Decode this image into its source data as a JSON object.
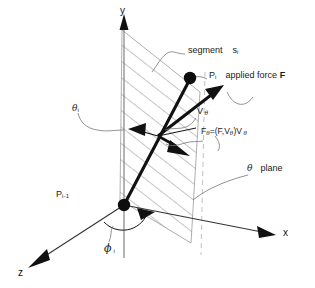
{
  "figure": {
    "background": "#ffffff",
    "ink": "#1a1a1a",
    "hatch_color": "#8c8c8c",
    "axes": {
      "y_label": "y",
      "x_label": "x",
      "z_label": "z"
    },
    "points": {
      "p_i": {
        "base": "P",
        "sub": "i"
      },
      "p_i_minus_1": {
        "base": "P",
        "sub": "i-1"
      }
    },
    "angles": {
      "theta_i": {
        "greek": "θ",
        "sub": "i"
      },
      "phi_i": {
        "greek": "ϕ",
        "sub": "i"
      }
    },
    "annotations": {
      "segment": {
        "text": "segment",
        "symbol": "s",
        "sub": "i"
      },
      "applied_force": {
        "point": "P",
        "point_sub": "i",
        "text": "applied force",
        "vector": "F"
      },
      "v_theta": {
        "base": "V",
        "sub": "θ"
      },
      "f_theta_formula": {
        "lhs_base": "F",
        "lhs_sub": "θ",
        "eq": "=(F,V",
        "mid_sub": "θ",
        "close": ")V",
        "rhs_sub": "θ"
      },
      "theta_plane": {
        "greek": "θ",
        "text": "plane"
      }
    }
  }
}
